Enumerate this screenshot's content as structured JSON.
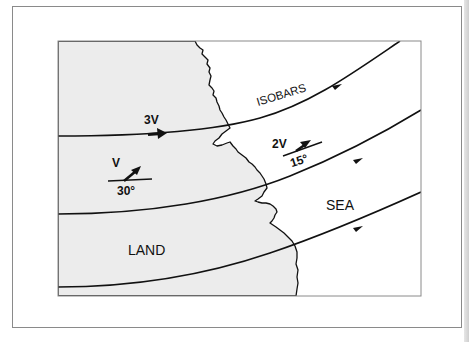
{
  "diagram": {
    "regions": {
      "land_label": "LAND",
      "sea_label": "SEA"
    },
    "isobars_label": "ISOBARS",
    "wind_vectors": [
      {
        "speed_label": "3V",
        "angle_label": ""
      },
      {
        "speed_label": "V",
        "angle_label": "30°"
      },
      {
        "speed_label": "2V",
        "angle_label": "15°"
      }
    ],
    "colors": {
      "land": "#ececec",
      "sea": "#ffffff",
      "line": "#111111",
      "frame": "#8a8a8a"
    }
  }
}
